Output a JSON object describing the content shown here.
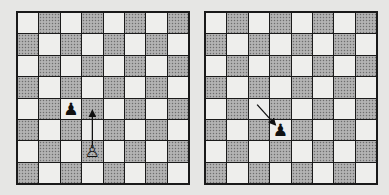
{
  "diagrams": [
    {
      "id": "left",
      "top_left_square": "light",
      "pieces": [
        {
          "square": "c4",
          "color": "black",
          "type": "pawn",
          "glyph": "♟"
        },
        {
          "square": "d2",
          "color": "white",
          "type": "pawn",
          "glyph": "♙"
        }
      ],
      "arrows": [
        {
          "from": "d2",
          "to": "d4"
        }
      ]
    },
    {
      "id": "right",
      "top_left_square": "light",
      "pieces": [
        {
          "square": "d3",
          "color": "black",
          "type": "pawn",
          "glyph": "♟"
        }
      ],
      "arrows": [
        {
          "from": "c4",
          "to": "d3"
        }
      ]
    }
  ],
  "colors": {
    "background": "#e6e6e4",
    "light_square": "#eeeeec",
    "dark_square": "#a9a9a9",
    "border": "#1a1a1a"
  }
}
